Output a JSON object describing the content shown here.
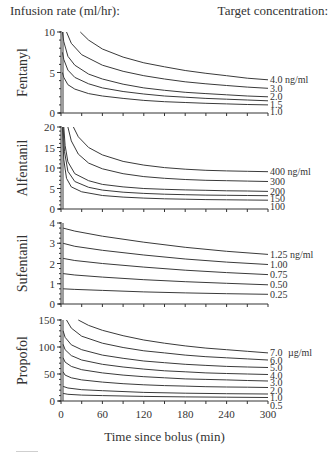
{
  "header": {
    "left": "Infusion rate (ml/hr):",
    "right": "Target concentration:"
  },
  "chart_data": [
    {
      "type": "line",
      "title": "Fentanyl",
      "ylabel": "Fentanyl",
      "xlabel": "Time since bolus (min)",
      "xlim": [
        0,
        300
      ],
      "ylim": [
        0,
        10
      ],
      "yticks": [
        0,
        5,
        10
      ],
      "unit": "ng/ml",
      "series": [
        {
          "name": "4.0 ng/ml",
          "label": "4.0 ng/ml",
          "x": [
            28,
            40,
            60,
            90,
            120,
            150,
            180,
            210,
            240,
            270,
            300
          ],
          "y": [
            10,
            9.0,
            7.9,
            6.9,
            6.2,
            5.7,
            5.25,
            4.9,
            4.6,
            4.3,
            4.1
          ]
        },
        {
          "name": "3.0 ng/ml",
          "label": "3.0",
          "x": [
            8,
            15,
            30,
            60,
            90,
            120,
            150,
            180,
            210,
            240,
            270,
            300
          ],
          "y": [
            10,
            8.6,
            7.2,
            5.9,
            5.15,
            4.6,
            4.2,
            3.85,
            3.6,
            3.4,
            3.2,
            3.05
          ]
        },
        {
          "name": "2.0 ng/ml",
          "label": "2.0",
          "x": [
            2,
            4,
            10,
            20,
            40,
            60,
            90,
            120,
            150,
            180,
            210,
            240,
            270,
            300
          ],
          "y": [
            10,
            8.8,
            7.0,
            5.9,
            4.8,
            4.2,
            3.55,
            3.1,
            2.8,
            2.55,
            2.4,
            2.25,
            2.1,
            2.0
          ]
        },
        {
          "name": "1.5 ng/ml",
          "label": "1.5",
          "x": [
            2,
            4,
            10,
            20,
            40,
            60,
            90,
            120,
            150,
            180,
            210,
            240,
            270,
            300
          ],
          "y": [
            7.5,
            6.6,
            5.3,
            4.4,
            3.6,
            3.1,
            2.65,
            2.35,
            2.1,
            1.95,
            1.8,
            1.7,
            1.6,
            1.5
          ]
        },
        {
          "name": "1.0 ng/ml",
          "label": "1.0",
          "x": [
            2,
            4,
            10,
            20,
            40,
            60,
            90,
            120,
            150,
            180,
            210,
            240,
            270,
            300
          ],
          "y": [
            5.0,
            4.4,
            3.5,
            2.95,
            2.4,
            2.1,
            1.8,
            1.55,
            1.4,
            1.3,
            1.2,
            1.12,
            1.05,
            1.0
          ]
        }
      ]
    },
    {
      "type": "line",
      "title": "Alfentanil",
      "ylabel": "Alfentanil",
      "xlabel": "Time since bolus (min)",
      "xlim": [
        0,
        300
      ],
      "ylim": [
        0,
        20
      ],
      "yticks": [
        0,
        5,
        10,
        15,
        20
      ],
      "unit": "ng/ml",
      "series": [
        {
          "name": "400 ng/ml",
          "label": "400 ng/ml",
          "x": [
            18,
            25,
            40,
            60,
            90,
            120,
            150,
            180,
            210,
            240,
            270,
            300
          ],
          "y": [
            20,
            17.6,
            15.0,
            13.2,
            11.6,
            10.7,
            10.1,
            9.7,
            9.45,
            9.3,
            9.2,
            9.1
          ]
        },
        {
          "name": "300 ng/ml",
          "label": "300",
          "x": [
            10,
            15,
            25,
            40,
            60,
            90,
            120,
            150,
            180,
            210,
            240,
            270,
            300
          ],
          "y": [
            20,
            16.6,
            13.4,
            11.2,
            9.8,
            8.6,
            7.9,
            7.5,
            7.2,
            7.0,
            6.9,
            6.8,
            6.7
          ]
        },
        {
          "name": "200 ng/ml",
          "label": "200",
          "x": [
            4,
            6,
            10,
            20,
            40,
            60,
            90,
            120,
            150,
            180,
            210,
            240,
            270,
            300
          ],
          "y": [
            20,
            15.5,
            11.5,
            8.6,
            6.9,
            6.0,
            5.4,
            5.0,
            4.8,
            4.65,
            4.55,
            4.45,
            4.4,
            4.3
          ]
        },
        {
          "name": "150 ng/ml",
          "label": "150",
          "x": [
            3,
            5,
            10,
            20,
            40,
            60,
            90,
            120,
            150,
            180,
            210,
            240,
            270,
            300
          ],
          "y": [
            20,
            14.0,
            9.2,
            6.7,
            5.3,
            4.6,
            4.1,
            3.8,
            3.6,
            3.5,
            3.4,
            3.35,
            3.3,
            3.25
          ]
        },
        {
          "name": "100 ng/ml",
          "label": "100",
          "x": [
            2,
            4,
            8,
            15,
            30,
            60,
            90,
            120,
            150,
            180,
            210,
            240,
            270,
            300
          ],
          "y": [
            20,
            12.0,
            7.5,
            5.4,
            4.2,
            3.3,
            2.9,
            2.65,
            2.5,
            2.4,
            2.3,
            2.25,
            2.2,
            2.15
          ]
        }
      ]
    },
    {
      "type": "line",
      "title": "Sufentanil",
      "ylabel": "Sufentanil",
      "xlabel": "Time since bolus (min)",
      "xlim": [
        0,
        300
      ],
      "ylim": [
        0,
        4
      ],
      "yticks": [
        0,
        1,
        2,
        3,
        4
      ],
      "unit": "ng/ml",
      "series": [
        {
          "name": "1.25 ng/ml",
          "label": "1.25 ng/ml",
          "x": [
            3,
            20,
            60,
            120,
            180,
            240,
            300
          ],
          "y": [
            3.75,
            3.6,
            3.35,
            3.05,
            2.8,
            2.6,
            2.45
          ]
        },
        {
          "name": "1.00 ng/ml",
          "label": "1.00",
          "x": [
            3,
            20,
            60,
            120,
            180,
            240,
            300
          ],
          "y": [
            3.0,
            2.85,
            2.65,
            2.42,
            2.22,
            2.07,
            1.95
          ]
        },
        {
          "name": "0.75 ng/ml",
          "label": "0.75",
          "x": [
            3,
            20,
            60,
            120,
            180,
            240,
            300
          ],
          "y": [
            2.25,
            2.15,
            2.0,
            1.82,
            1.67,
            1.55,
            1.45
          ]
        },
        {
          "name": "0.50 ng/ml",
          "label": "0.50",
          "x": [
            3,
            20,
            60,
            120,
            180,
            240,
            300
          ],
          "y": [
            1.5,
            1.43,
            1.33,
            1.2,
            1.1,
            1.02,
            0.95
          ]
        },
        {
          "name": "0.25 ng/ml",
          "label": "0.25",
          "x": [
            3,
            20,
            60,
            120,
            180,
            240,
            300
          ],
          "y": [
            0.75,
            0.72,
            0.67,
            0.6,
            0.55,
            0.51,
            0.48
          ]
        }
      ]
    },
    {
      "type": "line",
      "title": "Propofol",
      "ylabel": "Propofol",
      "xlabel": "Time since bolus (min)",
      "xlim": [
        0,
        300
      ],
      "ylim": [
        0,
        150
      ],
      "yticks": [
        0,
        50,
        100,
        150
      ],
      "xticks": [
        0,
        60,
        120,
        180,
        240,
        300
      ],
      "unit": "µg/ml",
      "series": [
        {
          "name": "7.0 µg/ml",
          "label": "7.0",
          "x": [
            25,
            40,
            60,
            90,
            120,
            150,
            180,
            210,
            240,
            270,
            300
          ],
          "y": [
            150,
            140,
            131,
            121,
            113,
            107,
            102,
            98,
            95,
            92,
            89
          ]
        },
        {
          "name": "6.0 µg/ml",
          "label": "6.0",
          "x": [
            8,
            15,
            30,
            60,
            90,
            120,
            150,
            180,
            210,
            240,
            270,
            300
          ],
          "y": [
            150,
            135,
            120,
            107,
            99,
            93,
            89,
            85,
            82,
            80,
            78,
            76
          ]
        },
        {
          "name": "5.0 µg/ml",
          "label": "5.0",
          "x": [
            3,
            6,
            15,
            30,
            60,
            90,
            120,
            150,
            180,
            210,
            240,
            270,
            300
          ],
          "y": [
            130,
            118,
            104,
            95,
            85,
            79,
            74,
            71,
            68,
            66,
            64,
            63,
            62
          ]
        },
        {
          "name": "4.0 µg/ml",
          "label": "4.0",
          "x": [
            3,
            6,
            15,
            30,
            60,
            90,
            120,
            150,
            180,
            210,
            240,
            270,
            300
          ],
          "y": [
            105,
            95,
            84,
            76,
            68,
            63,
            59,
            56,
            54,
            52,
            51,
            50,
            49
          ]
        },
        {
          "name": "3.0 µg/ml",
          "label": "3.0",
          "x": [
            3,
            6,
            15,
            30,
            60,
            90,
            120,
            150,
            180,
            210,
            240,
            270,
            300
          ],
          "y": [
            80,
            72,
            64,
            58,
            52,
            48,
            45,
            43,
            41,
            40,
            39,
            38,
            37
          ]
        },
        {
          "name": "2.0 µg/ml",
          "label": "2.0",
          "x": [
            3,
            6,
            15,
            30,
            60,
            90,
            120,
            150,
            180,
            210,
            240,
            270,
            300
          ],
          "y": [
            54,
            48,
            43,
            39,
            35,
            32,
            30,
            28.5,
            27.5,
            26.5,
            26,
            25.5,
            25
          ]
        },
        {
          "name": "1.0 µg/ml",
          "label": "1.0",
          "x": [
            3,
            10,
            30,
            60,
            120,
            180,
            240,
            300
          ],
          "y": [
            27,
            24,
            21,
            19,
            16,
            14.5,
            13.5,
            13
          ]
        },
        {
          "name": "0.5 µg/ml",
          "label": "0.5",
          "x": [
            3,
            10,
            30,
            60,
            120,
            180,
            240,
            300
          ],
          "y": [
            14,
            12.5,
            11,
            10,
            8.5,
            7.5,
            7,
            6.5
          ]
        }
      ]
    }
  ],
  "panels": [
    {
      "ylabel": "Fentanyl",
      "unit_label": "ng/ml"
    },
    {
      "ylabel": "Alfentanil",
      "unit_label": "ng/ml"
    },
    {
      "ylabel": "Sufentanil",
      "unit_label": "ng/ml"
    },
    {
      "ylabel": "Propofol",
      "unit_label": "µg/ml"
    }
  ],
  "xaxis": {
    "ticks": [
      "0",
      "60",
      "120",
      "180",
      "240",
      "300"
    ],
    "title": "Time since bolus (min)"
  }
}
